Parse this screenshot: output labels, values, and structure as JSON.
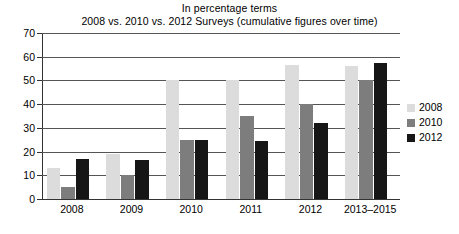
{
  "chart_data": {
    "type": "bar",
    "title": "In percentage terms",
    "subtitle": "2008 vs. 2010 vs. 2012 Surveys (cumulative figures over time)",
    "xlabel": "",
    "ylabel": "",
    "ylim": [
      0,
      70
    ],
    "ytick_step": 10,
    "yticks": [
      0,
      10,
      20,
      30,
      40,
      50,
      60,
      70
    ],
    "ytick_labels": [
      "0",
      "10",
      "20",
      "30",
      "40",
      "50",
      "60",
      "70"
    ],
    "grid": true,
    "grid_axis": "y",
    "legend_position": "right",
    "categories": [
      "2008",
      "2009",
      "2010",
      "2011",
      "2012",
      "2013–2015"
    ],
    "series": [
      {
        "name": "2008",
        "color": "#dcdcdc",
        "values": [
          13,
          19,
          50,
          50,
          56.5,
          56
        ]
      },
      {
        "name": "2010",
        "color": "#7d7d7d",
        "values": [
          5,
          10,
          25,
          35,
          40,
          50
        ]
      },
      {
        "name": "2012",
        "color": "#161616",
        "values": [
          17,
          16.5,
          25,
          24.5,
          32,
          57.5
        ]
      }
    ]
  }
}
